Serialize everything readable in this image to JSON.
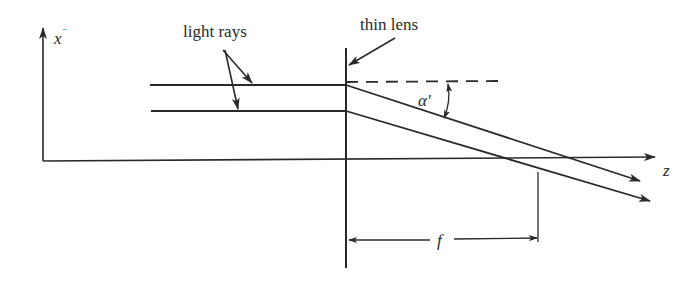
{
  "diagram": {
    "type": "thin lens focusing parallel rays",
    "labels": {
      "x_axis": "x",
      "x_axis_mark": "¨",
      "z_axis": "z",
      "lens": "thin lens",
      "rays": "light rays",
      "angle": "α′",
      "focal_length": "f"
    },
    "colors": {
      "ink": "#2a2a2a",
      "background": "#ffffff"
    },
    "elements": [
      {
        "id": "x-axis",
        "kind": "arrow",
        "from": [
          43,
          150
        ],
        "to": [
          43,
          28
        ]
      },
      {
        "id": "z-axis",
        "kind": "arrow",
        "from": [
          43,
          161
        ],
        "to": [
          655,
          158
        ]
      },
      {
        "id": "lens",
        "kind": "line",
        "from": [
          346,
          48
        ],
        "to": [
          346,
          268
        ]
      },
      {
        "id": "ray-upper",
        "kind": "polyline",
        "points": [
          [
            150,
            85
          ],
          [
            346,
            85
          ],
          [
            640,
            181
          ]
        ]
      },
      {
        "id": "ray-lower",
        "kind": "polyline",
        "points": [
          [
            150,
            111
          ],
          [
            346,
            111
          ],
          [
            650,
            201
          ]
        ]
      },
      {
        "id": "reference-dashed",
        "kind": "dashed-line",
        "from": [
          346,
          82
        ],
        "to": [
          498,
          81
        ]
      },
      {
        "id": "focal-marker",
        "kind": "line",
        "from": [
          538,
          172
        ],
        "to": [
          538,
          242
        ]
      },
      {
        "id": "focal-dimension",
        "kind": "double-arrow",
        "from": [
          348,
          240
        ],
        "to": [
          538,
          238
        ]
      }
    ]
  }
}
